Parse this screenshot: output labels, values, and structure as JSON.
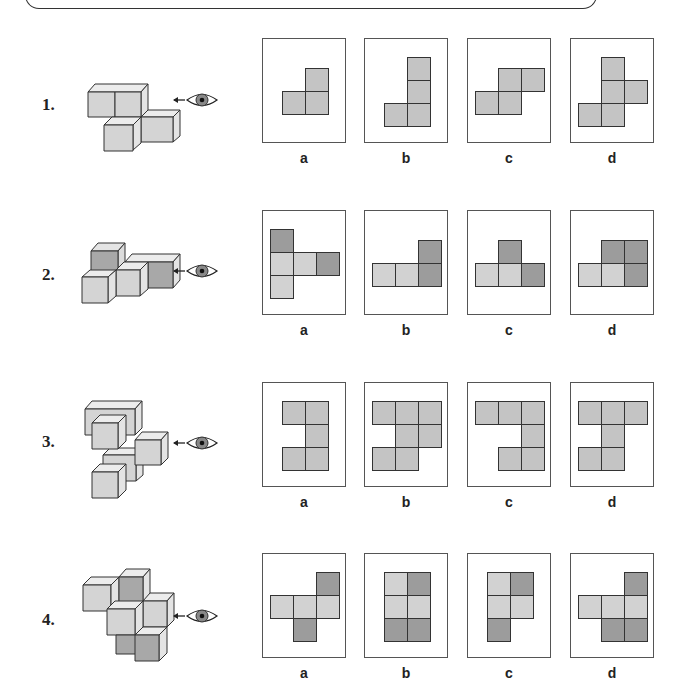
{
  "colors": {
    "light": "#d2d2d2",
    "mid": "#c4c4c4",
    "dark": "#9c9c9c",
    "outline": "#333333"
  },
  "questions": [
    {
      "number": "1.",
      "options": [
        {
          "label": "a",
          "cells": [
            [
              1,
              0,
              "m"
            ],
            [
              0,
              1,
              "m"
            ],
            [
              1,
              1,
              "m"
            ]
          ]
        },
        {
          "label": "b",
          "cells": [
            [
              1,
              0,
              "m"
            ],
            [
              1,
              1,
              "m"
            ],
            [
              0,
              2,
              "m"
            ],
            [
              1,
              2,
              "m"
            ]
          ]
        },
        {
          "label": "c",
          "cells": [
            [
              1,
              0,
              "m"
            ],
            [
              2,
              0,
              "m"
            ],
            [
              0,
              1,
              "m"
            ],
            [
              1,
              1,
              "m"
            ]
          ]
        },
        {
          "label": "d",
          "cells": [
            [
              1,
              0,
              "m"
            ],
            [
              1,
              1,
              "m"
            ],
            [
              2,
              1,
              "m"
            ],
            [
              0,
              2,
              "m"
            ],
            [
              1,
              2,
              "m"
            ]
          ]
        }
      ]
    },
    {
      "number": "2.",
      "options": [
        {
          "label": "a",
          "cells": [
            [
              0,
              0,
              "d"
            ],
            [
              0,
              1,
              "l"
            ],
            [
              1,
              1,
              "l"
            ],
            [
              2,
              1,
              "d"
            ],
            [
              0,
              2,
              "l"
            ]
          ]
        },
        {
          "label": "b",
          "cells": [
            [
              2,
              0,
              "d"
            ],
            [
              0,
              1,
              "l"
            ],
            [
              1,
              1,
              "l"
            ],
            [
              2,
              1,
              "d"
            ]
          ]
        },
        {
          "label": "c",
          "cells": [
            [
              1,
              0,
              "d"
            ],
            [
              0,
              1,
              "l"
            ],
            [
              1,
              1,
              "l"
            ],
            [
              2,
              1,
              "d"
            ]
          ]
        },
        {
          "label": "d",
          "cells": [
            [
              1,
              0,
              "d"
            ],
            [
              2,
              0,
              "d"
            ],
            [
              0,
              1,
              "l"
            ],
            [
              1,
              1,
              "l"
            ],
            [
              2,
              1,
              "d"
            ]
          ]
        }
      ]
    },
    {
      "number": "3.",
      "options": [
        {
          "label": "a",
          "cells": [
            [
              0,
              0,
              "m"
            ],
            [
              1,
              0,
              "m"
            ],
            [
              1,
              1,
              "m"
            ],
            [
              0,
              2,
              "m"
            ],
            [
              1,
              2,
              "m"
            ]
          ]
        },
        {
          "label": "b",
          "cells": [
            [
              0,
              0,
              "m"
            ],
            [
              1,
              0,
              "m"
            ],
            [
              2,
              0,
              "m"
            ],
            [
              1,
              1,
              "m"
            ],
            [
              2,
              1,
              "m"
            ],
            [
              0,
              2,
              "m"
            ],
            [
              1,
              2,
              "m"
            ]
          ]
        },
        {
          "label": "c",
          "cells": [
            [
              0,
              0,
              "m"
            ],
            [
              1,
              0,
              "m"
            ],
            [
              2,
              0,
              "m"
            ],
            [
              2,
              1,
              "m"
            ],
            [
              1,
              2,
              "m"
            ],
            [
              2,
              2,
              "m"
            ]
          ]
        },
        {
          "label": "d",
          "cells": [
            [
              0,
              0,
              "m"
            ],
            [
              1,
              0,
              "m"
            ],
            [
              2,
              0,
              "m"
            ],
            [
              1,
              1,
              "m"
            ],
            [
              0,
              2,
              "m"
            ],
            [
              1,
              2,
              "m"
            ]
          ]
        }
      ]
    },
    {
      "number": "4.",
      "options": [
        {
          "label": "a",
          "cells": [
            [
              2,
              0,
              "d"
            ],
            [
              0,
              1,
              "l"
            ],
            [
              1,
              1,
              "l"
            ],
            [
              2,
              1,
              "l"
            ],
            [
              1,
              2,
              "d"
            ]
          ]
        },
        {
          "label": "b",
          "cells": [
            [
              0,
              0,
              "l"
            ],
            [
              1,
              0,
              "d"
            ],
            [
              0,
              1,
              "l"
            ],
            [
              1,
              1,
              "l"
            ],
            [
              0,
              2,
              "d"
            ],
            [
              1,
              2,
              "d"
            ]
          ]
        },
        {
          "label": "c",
          "cells": [
            [
              0,
              0,
              "l"
            ],
            [
              1,
              0,
              "d"
            ],
            [
              0,
              1,
              "l"
            ],
            [
              1,
              1,
              "l"
            ],
            [
              0,
              2,
              "d"
            ]
          ]
        },
        {
          "label": "d",
          "cells": [
            [
              2,
              0,
              "d"
            ],
            [
              0,
              1,
              "l"
            ],
            [
              1,
              1,
              "l"
            ],
            [
              2,
              1,
              "l"
            ],
            [
              1,
              2,
              "d"
            ],
            [
              2,
              2,
              "d"
            ]
          ]
        }
      ]
    }
  ]
}
